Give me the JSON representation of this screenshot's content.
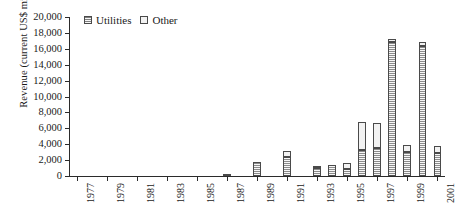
{
  "chart_data": {
    "type": "bar",
    "title": "",
    "subtitle": "",
    "xlabel": "",
    "ylabel": "Revenue (current US$ mil)",
    "stacked": true,
    "grid": false,
    "legend_position": "top-left-inside",
    "ylim": [
      0,
      20000
    ],
    "ytick_step": 2000,
    "ytick_labels": [
      "20,000",
      "18,000",
      "16,000",
      "14,000",
      "12,000",
      "10,000",
      "8,000",
      "6,000",
      "4,000",
      "2,000",
      "0"
    ],
    "ytick_values": [
      20000,
      18000,
      16000,
      14000,
      12000,
      10000,
      8000,
      6000,
      4000,
      2000,
      0
    ],
    "xlim": [
      1977,
      2001
    ],
    "categories": [
      1977,
      1978,
      1979,
      1980,
      1981,
      1982,
      1983,
      1984,
      1985,
      1986,
      1987,
      1988,
      1989,
      1990,
      1991,
      1992,
      1993,
      1994,
      1995,
      1996,
      1997,
      1998,
      1999,
      2000,
      2001
    ],
    "xtick_labels": [
      "1977",
      "1979",
      "1981",
      "1983",
      "1985",
      "1987",
      "1989",
      "1991",
      "1993",
      "1995",
      "1997",
      "1999",
      "2001"
    ],
    "xtick_values": [
      1977,
      1979,
      1981,
      1983,
      1985,
      1987,
      1989,
      1991,
      1993,
      1995,
      1997,
      1999,
      2001
    ],
    "series": [
      {
        "name": "Utilities",
        "color": "#c9c9c9",
        "pattern": "hatched",
        "values": [
          0,
          0,
          0,
          0,
          0,
          0,
          0,
          0,
          0,
          0,
          130,
          0,
          1800,
          0,
          2400,
          0,
          1000,
          1350,
          900,
          3300,
          3500,
          16900,
          3000,
          16400,
          2900
        ]
      },
      {
        "name": "Other",
        "color": "#f2f2f2",
        "pattern": "solid",
        "values": [
          0,
          0,
          0,
          0,
          0,
          0,
          0,
          0,
          0,
          0,
          0,
          0,
          0,
          0,
          800,
          0,
          300,
          0,
          800,
          3500,
          3200,
          300,
          900,
          400,
          900
        ]
      }
    ],
    "totals": [
      0,
      0,
      0,
      0,
      0,
      0,
      0,
      0,
      0,
      0,
      130,
      0,
      1800,
      0,
      3200,
      0,
      1300,
      1350,
      1700,
      6800,
      6700,
      17200,
      3900,
      16800,
      3800
    ],
    "annotations": []
  },
  "legend": {
    "entries": [
      {
        "label": "Utilities",
        "swatch": "utilities"
      },
      {
        "label": "Other",
        "swatch": "other"
      }
    ]
  },
  "colors": {
    "axis": "#2b2b2b",
    "bar_border": "#4a4a4a",
    "utilities": "#c9c9c9",
    "other": "#f2f2f2",
    "background": "#ffffff"
  }
}
